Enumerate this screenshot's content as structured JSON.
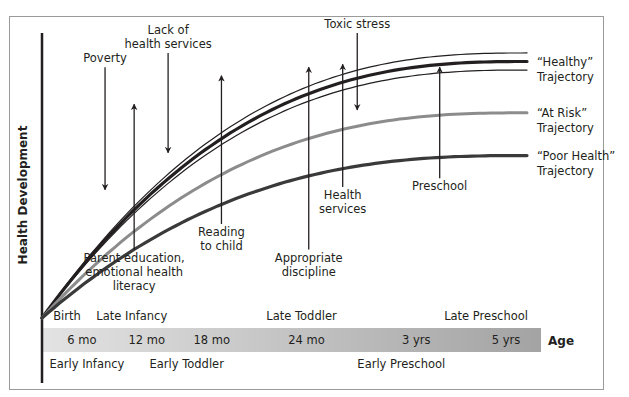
{
  "chart_data": {
    "type": "line",
    "title": "",
    "xlabel": "Age",
    "ylabel": "Health Development",
    "x_range": [
      0,
      1
    ],
    "y_range": [
      0,
      1
    ],
    "grid": false,
    "series": [
      {
        "name": "Healthy upper bound",
        "role": "healthy-thin",
        "color": "#231f20",
        "end_value": 0.93
      },
      {
        "name": "“Healthy” Trajectory",
        "role": "healthy-main",
        "color": "#231f20",
        "end_value": 0.9,
        "label_lines": [
          "“Healthy”",
          "Trajectory"
        ]
      },
      {
        "name": "Healthy lower bound",
        "role": "healthy-thin",
        "color": "#231f20",
        "end_value": 0.87
      },
      {
        "name": "“At Risk” Trajectory",
        "role": "at-risk",
        "color": "#8c8c8c",
        "end_value": 0.72,
        "label_lines": [
          "“At Risk”",
          "Trajectory"
        ]
      },
      {
        "name": "“Poor Health” Trajectory",
        "role": "poor-health",
        "color": "#3a3a3a",
        "end_value": 0.57,
        "label_lines": [
          "“Poor Health”",
          "Trajectory"
        ]
      }
    ],
    "annotations": [
      {
        "text_lines": [
          "Poverty"
        ],
        "direction": "down",
        "x": 0.13,
        "from": 0.88,
        "to": 0.45,
        "label_pos": "above"
      },
      {
        "text_lines": [
          "Lack of",
          "health services"
        ],
        "direction": "down",
        "x": 0.26,
        "from": 0.93,
        "to": 0.58,
        "label_pos": "above"
      },
      {
        "text_lines": [
          "Toxic stress"
        ],
        "direction": "down",
        "x": 0.65,
        "from": 1.0,
        "to": 0.73,
        "label_pos": "above"
      },
      {
        "text_lines": [
          "Parent education,",
          "emotional health",
          "literacy"
        ],
        "direction": "up",
        "x": 0.19,
        "from": 0.24,
        "to": 0.75,
        "label_pos": "below"
      },
      {
        "text_lines": [
          "Reading",
          "to child"
        ],
        "direction": "up",
        "x": 0.37,
        "from": 0.33,
        "to": 0.85,
        "label_pos": "below"
      },
      {
        "text_lines": [
          "Appropriate",
          "discipline"
        ],
        "direction": "up",
        "x": 0.55,
        "from": 0.24,
        "to": 0.88,
        "label_pos": "below"
      },
      {
        "text_lines": [
          "Health",
          "services"
        ],
        "direction": "up",
        "x": 0.62,
        "from": 0.46,
        "to": 0.89,
        "label_pos": "below"
      },
      {
        "text_lines": [
          "Preschool"
        ],
        "direction": "up",
        "x": 0.82,
        "from": 0.49,
        "to": 0.88,
        "label_pos": "below"
      }
    ],
    "age_ticks": [
      {
        "label": "6 mo",
        "x": 0.08
      },
      {
        "label": "12 mo",
        "x": 0.21
      },
      {
        "label": "18 mo",
        "x": 0.34
      },
      {
        "label": "24 mo",
        "x": 0.53
      },
      {
        "label": "3 yrs",
        "x": 0.75
      },
      {
        "label": "5 yrs",
        "x": 0.93
      }
    ],
    "stages_above": [
      {
        "label": "Birth",
        "x": 0.05
      },
      {
        "label": "Late Infancy",
        "x": 0.18
      },
      {
        "label": "Late Toddler",
        "x": 0.52
      },
      {
        "label": "Late Preschool",
        "x": 0.89
      }
    ],
    "stages_below": [
      {
        "label": "Early Infancy",
        "x": 0.09
      },
      {
        "label": "Early Toddler",
        "x": 0.29
      },
      {
        "label": "Early Preschool",
        "x": 0.72
      }
    ],
    "bar_colors": [
      "#e3e3e3",
      "#a3a3a3"
    ]
  }
}
